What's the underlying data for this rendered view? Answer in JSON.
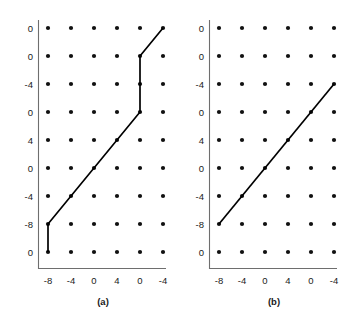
{
  "figure": {
    "background": "#ffffff",
    "dot_color": "#111111",
    "line_color": "#000000",
    "axis_color": "#6e6e6e",
    "panels": [
      {
        "id": "a",
        "caption": "(a)",
        "y_tick_labels": [
          "0",
          "0",
          "-4",
          "0",
          "4",
          "0",
          "-4",
          "-8",
          "0"
        ],
        "x_tick_labels": [
          "-8",
          "-4",
          "0",
          "4",
          "0",
          "-4"
        ],
        "grid": {
          "columns": 6,
          "rows": 9
        },
        "path_points": [
          [
            1,
            9
          ],
          [
            1,
            8
          ],
          [
            5,
            4
          ],
          [
            5,
            2
          ],
          [
            6,
            1
          ]
        ]
      },
      {
        "id": "b",
        "caption": "(b)",
        "y_tick_labels": [
          "0",
          "0",
          "-4",
          "0",
          "4",
          "0",
          "-4",
          "-8",
          "0"
        ],
        "x_tick_labels": [
          "-8",
          "-4",
          "0",
          "4",
          "0",
          "-4"
        ],
        "grid": {
          "columns": 6,
          "rows": 9
        },
        "path_points": [
          [
            1,
            8
          ],
          [
            6,
            3
          ]
        ]
      }
    ]
  },
  "chart_data": {
    "type": "line",
    "title": "",
    "xlabel": "",
    "ylabel": "",
    "grid": false,
    "legend": "none",
    "note": "Two side-by-side panels, each a 6x9 lattice of dots with wrapped axis tick labels.",
    "subplots": [
      {
        "label": "(a)",
        "x_ticks": [
          "-8",
          "-4",
          "0",
          "4",
          "0",
          "-4"
        ],
        "y_ticks": [
          "0",
          "0",
          "-4",
          "0",
          "4",
          "0",
          "-4",
          "-8",
          "0"
        ],
        "lattice_columns": 6,
        "lattice_rows": 9,
        "series": [
          {
            "name": "path-a",
            "points_grid_col_row": [
              [
                1,
                9
              ],
              [
                1,
                8
              ],
              [
                5,
                4
              ],
              [
                5,
                2
              ],
              [
                6,
                1
              ]
            ],
            "points_labeled": [
              {
                "x": "-8",
                "y": "0"
              },
              {
                "x": "-8",
                "y": "-8"
              },
              {
                "x": "0",
                "y": "0"
              },
              {
                "x": "0",
                "y": "0"
              },
              {
                "x": "-4",
                "y": "0"
              }
            ]
          }
        ]
      },
      {
        "label": "(b)",
        "x_ticks": [
          "-8",
          "-4",
          "0",
          "4",
          "0",
          "-4"
        ],
        "y_ticks": [
          "0",
          "0",
          "-4",
          "0",
          "4",
          "0",
          "-4",
          "-8",
          "0"
        ],
        "lattice_columns": 6,
        "lattice_rows": 9,
        "series": [
          {
            "name": "path-b",
            "points_grid_col_row": [
              [
                1,
                8
              ],
              [
                6,
                3
              ]
            ],
            "points_labeled": [
              {
                "x": "-8",
                "y": "-8"
              },
              {
                "x": "-4",
                "y": "-4"
              }
            ]
          }
        ]
      }
    ]
  }
}
